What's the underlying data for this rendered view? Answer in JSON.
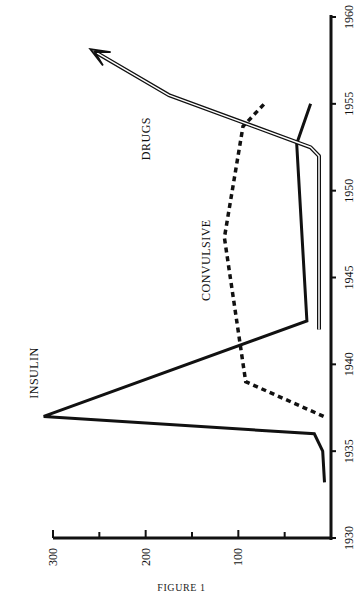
{
  "figure": {
    "caption": "FIGURE 1"
  },
  "chart_data": {
    "type": "line",
    "title": "",
    "caption": "FIGURE 1",
    "orientation": "rotated 90 degrees (time axis vertical on right, value axis horizontal at bottom)",
    "xlabel": "Year",
    "ylabel": "",
    "xlim": [
      1930,
      1960
    ],
    "ylim": [
      0,
      300
    ],
    "x_ticks": [
      1930,
      1935,
      1940,
      1945,
      1950,
      1955,
      1960
    ],
    "x_tick_labels": [
      "1930",
      "1935",
      "1940",
      "1945",
      "1950",
      "1955",
      "1960"
    ],
    "y_ticks": [
      0,
      50,
      100,
      150,
      200,
      250,
      300
    ],
    "y_tick_labels": [
      "",
      "",
      "100",
      "",
      "200",
      "",
      "300"
    ],
    "grid": false,
    "legend": "none (series labeled inline)",
    "series": [
      {
        "name": "INSULIN",
        "style": "solid thick",
        "points": [
          [
            1933.2,
            7
          ],
          [
            1935,
            9
          ],
          [
            1936,
            18
          ],
          [
            1937,
            310
          ],
          [
            1942.5,
            26
          ],
          [
            1952.7,
            37
          ],
          [
            1955,
            22
          ]
        ]
      },
      {
        "name": "CONVULSIVE",
        "style": "dashed thick",
        "points": [
          [
            1937,
            8
          ],
          [
            1939,
            92
          ],
          [
            1947.3,
            115
          ],
          [
            1953.7,
            95
          ],
          [
            1955,
            72
          ]
        ]
      },
      {
        "name": "DRUGS",
        "style": "double line with arrow",
        "points": [
          [
            1942,
            13
          ],
          [
            1952,
            13
          ],
          [
            1952.5,
            22
          ],
          [
            1955.5,
            175
          ],
          [
            1958,
            255
          ]
        ]
      }
    ],
    "annotations": [
      {
        "text": "INSULIN",
        "x": 1939.5,
        "y": 320
      },
      {
        "text": "CONVULSIVE",
        "x": 1946,
        "y": 135
      },
      {
        "text": "DRUGS",
        "x": 1953,
        "y": 200
      }
    ]
  }
}
